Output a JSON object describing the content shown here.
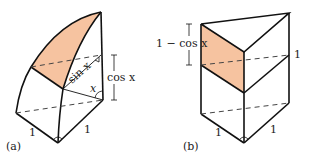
{
  "figure": {
    "panel_a": {
      "tag": "(a)",
      "labels": {
        "sin": "sin x",
        "cos": "cos x",
        "angle": "x",
        "edge_left": "1",
        "edge_right": "1"
      }
    },
    "panel_b": {
      "tag": "(b)",
      "labels": {
        "height": "1 − cos x",
        "side": "1",
        "edge_left": "1",
        "edge_right": "1"
      }
    },
    "colors": {
      "shade": "#f6c3a0",
      "stroke": "#111111",
      "dash": "#444444"
    }
  }
}
